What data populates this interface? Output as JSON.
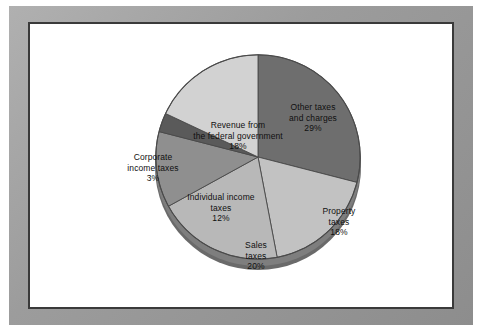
{
  "frame": {
    "name": "picture-frame",
    "border_color": "#9a9a9a",
    "inner_line_color": "#3a3a3a",
    "canvas_color": "#ffffff"
  },
  "chart_data": {
    "type": "pie",
    "title": "",
    "subtitle": "",
    "xlabel": "",
    "ylabel": "",
    "legend_position": "none",
    "grid": false,
    "three_d": true,
    "start_angle_deg": 0,
    "direction": "clockwise",
    "unit": "%",
    "categories": [
      "Other taxes and charges",
      "Property taxes",
      "Sales taxes",
      "Individual income taxes",
      "Corporate income taxes",
      "Revenue from the federal government"
    ],
    "values": [
      29,
      18,
      20,
      12,
      3,
      18
    ],
    "total": 100,
    "colors": [
      "#6e6e6e",
      "#c2c2c2",
      "#b8b8b8",
      "#8f8f8f",
      "#5a5a5a",
      "#d2d2d2"
    ],
    "slices": [
      {
        "label": "Other taxes and charges",
        "value": 29,
        "value_text": "29%",
        "label_lines": [
          "Other taxes",
          "and charges",
          "29%"
        ],
        "color": "#6e6e6e",
        "label_placement": "inside"
      },
      {
        "label": "Property taxes",
        "value": 18,
        "value_text": "18%",
        "label_lines": [
          "Property",
          "taxes",
          "18%"
        ],
        "color": "#c2c2c2",
        "label_placement": "inside"
      },
      {
        "label": "Sales taxes",
        "value": 20,
        "value_text": "20%",
        "label_lines": [
          "Sales",
          "taxes",
          "20%"
        ],
        "color": "#b8b8b8",
        "label_placement": "inside"
      },
      {
        "label": "Individual income taxes",
        "value": 12,
        "value_text": "12%",
        "label_lines": [
          "Individual income",
          "taxes",
          "12%"
        ],
        "color": "#8f8f8f",
        "label_placement": "inside"
      },
      {
        "label": "Corporate income taxes",
        "value": 3,
        "value_text": "3%",
        "label_lines": [
          "Corporate",
          "income taxes",
          "3%"
        ],
        "color": "#5a5a5a",
        "label_placement": "outside-left"
      },
      {
        "label": "Revenue from the federal government",
        "value": 18,
        "value_text": "18%",
        "label_lines": [
          "Revenue from",
          "the federal government",
          "18%"
        ],
        "color": "#d2d2d2",
        "label_placement": "inside"
      }
    ]
  }
}
